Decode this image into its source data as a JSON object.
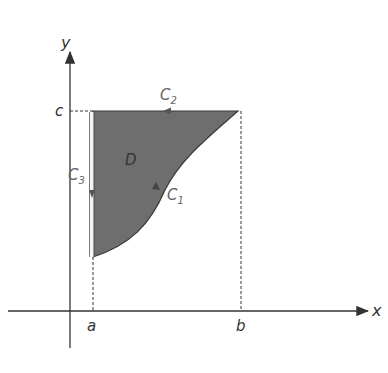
{
  "diagram": {
    "axes": {
      "x_label": "x",
      "y_label": "y"
    },
    "ticks": {
      "a": "a",
      "b": "b",
      "c": "c"
    },
    "region_label": "D",
    "curves": {
      "c1": {
        "letter": "C",
        "sub": "1"
      },
      "c2": {
        "letter": "C",
        "sub": "2"
      },
      "c3": {
        "letter": "C",
        "sub": "3"
      }
    },
    "colors": {
      "region_fill": "#6e6e6e",
      "axis": "#333333",
      "boundary": "#555555"
    }
  }
}
